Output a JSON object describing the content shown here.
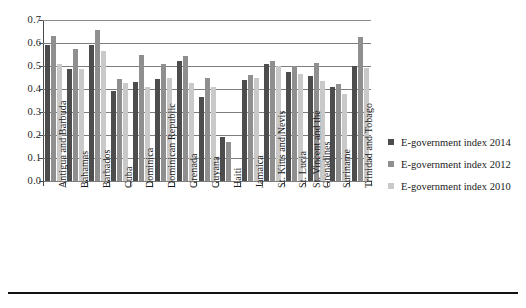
{
  "figure": {
    "background": "#ffffff",
    "width": 526,
    "height": 308
  },
  "legend": {
    "position": "right",
    "items": [
      {
        "label": "E-government index 2014",
        "color": "#4d4d4d"
      },
      {
        "label": "E-government index 2012",
        "color": "#8f8f8f"
      },
      {
        "label": "E-government index 2010",
        "color": "#c9c9c9"
      }
    ]
  },
  "axis": {
    "y_ticks": [
      "0.0",
      "0.1",
      "0.2",
      "0.3",
      "0.4",
      "0.5",
      "0.6",
      "0.7"
    ]
  },
  "chart_data": {
    "type": "bar",
    "title": "",
    "subtitle": "",
    "xlabel": "",
    "ylabel": "",
    "ylim": [
      0.0,
      0.7
    ],
    "ytick_step": 0.1,
    "grid": true,
    "grid_axis": "y",
    "legend_position": "right",
    "orientation": "vertical",
    "grouping": "clustered",
    "categories": [
      "Antigua and Barbuda",
      "Bahamas",
      "Barbados",
      "Cuba",
      "Dominica",
      "Dominican Republic",
      "Grenada",
      "Guyana",
      "Haiti",
      "Jamaica",
      "St. Kitts and Nevis",
      "St. Lucia",
      "St. Vincent and the Grenadines",
      "Suriname",
      "Trinidad and Tobago"
    ],
    "series": [
      {
        "name": "E-government index 2014",
        "color": "#4d4d4d",
        "values": [
          0.59,
          0.485,
          0.59,
          0.39,
          0.43,
          0.445,
          0.52,
          0.365,
          0.19,
          0.44,
          0.51,
          0.475,
          0.455,
          0.41,
          0.5
        ]
      },
      {
        "name": "E-government index 2012",
        "color": "#8f8f8f",
        "values": [
          0.63,
          0.575,
          0.655,
          0.445,
          0.55,
          0.51,
          0.545,
          0.45,
          0.17,
          0.46,
          0.52,
          0.5,
          0.515,
          0.42,
          0.625
        ]
      },
      {
        "name": "E-government index 2010",
        "color": "#c9c9c9",
        "values": [
          0.51,
          0.485,
          0.565,
          0.425,
          0.41,
          0.45,
          0.425,
          0.41,
          0.0,
          0.45,
          0.5,
          0.465,
          0.435,
          0.38,
          0.49
        ]
      }
    ]
  }
}
